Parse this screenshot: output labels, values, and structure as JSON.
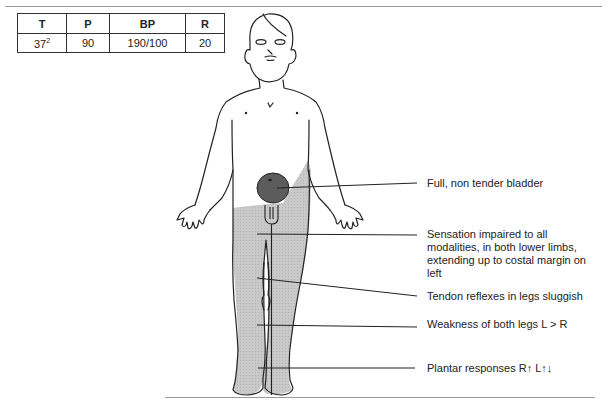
{
  "vitals_table": {
    "headers": [
      "T",
      "P",
      "BP",
      "R"
    ],
    "values": {
      "temperature_base": "37",
      "temperature_sup": "2",
      "pulse": "90",
      "blood_pressure": "190/100",
      "respiration": "20"
    }
  },
  "annotations": [
    {
      "id": "bladder",
      "text": "Full, non tender bladder"
    },
    {
      "id": "sensation",
      "text": "Sensation impaired to all modalities, in both lower limbs, extending up to costal margin on left"
    },
    {
      "id": "tendon",
      "text": "Tendon reflexes in legs sluggish"
    },
    {
      "id": "weakness",
      "text": "Weakness of both legs L > R"
    },
    {
      "id": "plantar",
      "text": "Plantar responses R↑ L↑↓"
    }
  ],
  "colors": {
    "impaired_shading": "#c4c4c4",
    "bladder_fill": "#5a5a5a",
    "outline": "#222222"
  }
}
